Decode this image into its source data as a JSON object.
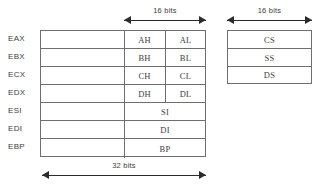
{
  "diagram": {
    "line_color": "#6e6e6e",
    "arrow_color": "#2b2b2b",
    "text_color": "#3d3d3d"
  },
  "dimensions": {
    "gp_16bit_label": "16 bits",
    "seg_16bit_label": "16 bits",
    "gp_32bit_label": "32 bits"
  },
  "general_registers": {
    "rows": [
      {
        "label": "EAX",
        "high": "AH",
        "low": "AL",
        "wide": null
      },
      {
        "label": "EBX",
        "high": "BH",
        "low": "BL",
        "wide": null
      },
      {
        "label": "ECX",
        "high": "CH",
        "low": "CL",
        "wide": null
      },
      {
        "label": "EDX",
        "high": "DH",
        "low": "DL",
        "wide": null
      },
      {
        "label": "ESI",
        "high": null,
        "low": null,
        "wide": "SI"
      },
      {
        "label": "EDI",
        "high": null,
        "low": null,
        "wide": "DI"
      },
      {
        "label": "EBP",
        "high": null,
        "low": null,
        "wide": "BP"
      }
    ]
  },
  "segment_registers": {
    "rows": [
      {
        "label": "CS"
      },
      {
        "label": "SS"
      },
      {
        "label": "DS"
      }
    ]
  }
}
